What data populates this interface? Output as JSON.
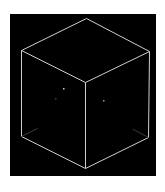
{
  "figure": {
    "background": "#ffffff",
    "canvas": {
      "x": 10,
      "y": 14,
      "width": 146,
      "height": 162,
      "color": "#000000"
    },
    "cube": {
      "edge_color": "#cfcfcf",
      "hidden_edge_color": "#3a3a3a",
      "vertices": {
        "top": [
          86,
          18
        ],
        "left_top": [
          21,
          50
        ],
        "right_top": [
          149,
          51
        ],
        "center": [
          85,
          82
        ],
        "left_bottom": [
          21,
          136
        ],
        "right_bottom": [
          148,
          137
        ],
        "bottom": [
          85,
          168
        ]
      },
      "dots": [
        {
          "x": 63,
          "y": 88,
          "opacity": 0.8
        },
        {
          "x": 55,
          "y": 98,
          "opacity": 0.25
        },
        {
          "x": 103,
          "y": 100,
          "opacity": 0.6
        }
      ]
    }
  }
}
